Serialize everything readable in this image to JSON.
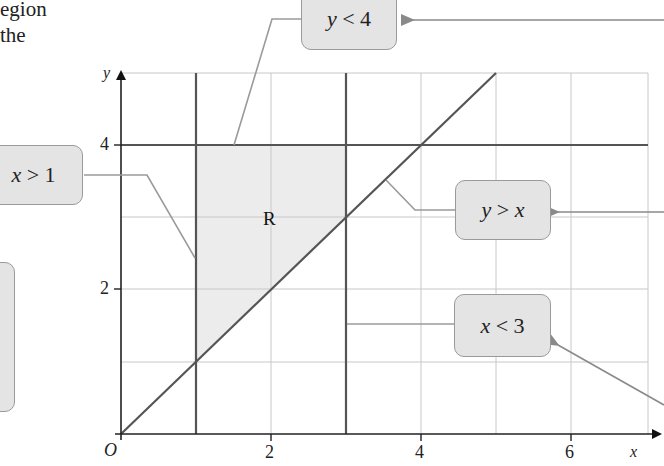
{
  "intro_text": {
    "line1": "egion",
    "line2": " the"
  },
  "axes": {
    "x_label": "x",
    "y_label": "y",
    "origin_label": "O",
    "x_ticks": [
      "2",
      "4",
      "6"
    ],
    "y_ticks": [
      "2",
      "4"
    ]
  },
  "region_label": "R",
  "labels": {
    "y_lt_4": {
      "var": "y",
      "op": " < ",
      "rhs": "4"
    },
    "x_gt_1": {
      "var": "x",
      "op": " > ",
      "rhs": "1"
    },
    "y_gt_x": {
      "var": "y",
      "op": " > ",
      "rhs": "x"
    },
    "x_lt_3": {
      "var": "x",
      "op": " < ",
      "rhs": "3"
    }
  },
  "colors": {
    "grid": "#c8c8c8",
    "boundary": "#555555",
    "shade": "#ececec",
    "label_bg": "#e4e4e4",
    "leader": "#9a9a9a"
  },
  "geometry": {
    "x_range": [
      0,
      7
    ],
    "y_range": [
      0,
      5
    ],
    "boundaries": [
      "x = 1",
      "x = 3",
      "y = 4",
      "y = x"
    ],
    "region_vertices": [
      [
        1,
        1
      ],
      [
        1,
        4
      ],
      [
        3,
        4
      ],
      [
        3,
        3
      ]
    ]
  }
}
